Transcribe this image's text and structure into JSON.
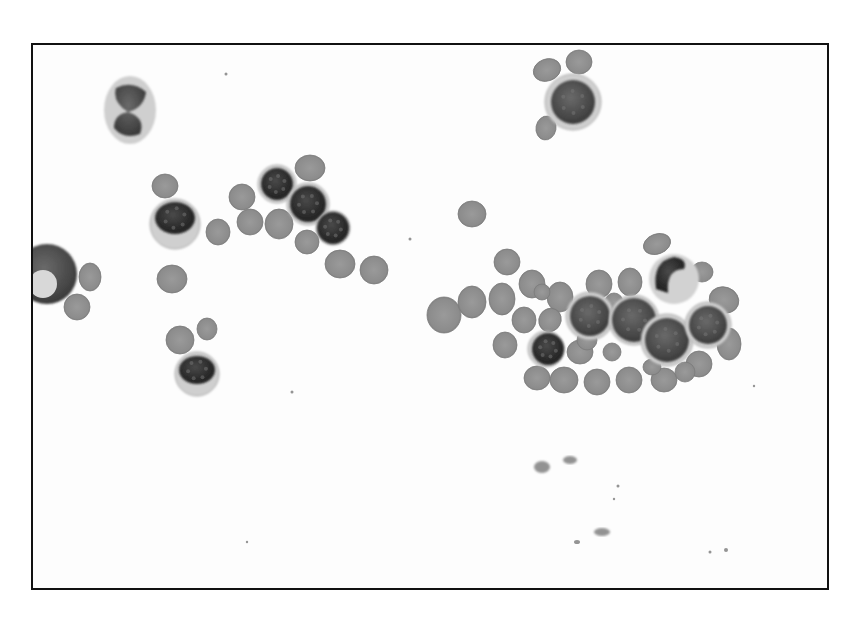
{
  "image": {
    "description": "Grayscale light micrograph of a peripheral blood smear showing clusters of red blood cells and several nucleated white blood cells",
    "colors": {
      "background": "#fdfdfd",
      "border": "#111111",
      "rbc": "#8e8e8e",
      "rbc_light": "#a8a8a8",
      "nucleus_dark": "#2a2a2a",
      "nucleus_mid": "#555555",
      "cytoplasm": "#c9c9c9"
    },
    "counts": {
      "red_blood_cells": 46,
      "white_blood_cells": 14
    }
  }
}
